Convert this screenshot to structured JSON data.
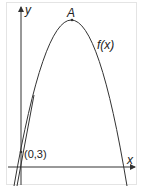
{
  "diagram": {
    "type": "function-graph",
    "axes": {
      "x_label": "x",
      "y_label": "y"
    },
    "curve": {
      "label": "f(x)",
      "shape": "downward parabola"
    },
    "points": [
      {
        "label": "A",
        "role": "maximum vertex"
      },
      {
        "label": "(0,3)",
        "role": "y-intercept"
      }
    ],
    "line": {
      "description": "steep line through (0,3)"
    }
  },
  "colors": {
    "stroke": "#333333",
    "frame": "#e4e4e4"
  }
}
